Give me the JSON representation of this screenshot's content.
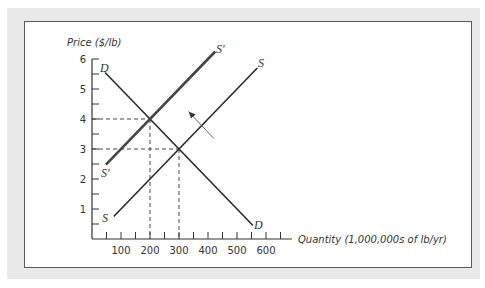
{
  "chart_data": {
    "type": "line",
    "title": "",
    "xlabel": "Quantity (1,000,000s of lb/yr)",
    "ylabel": "Price ($/lb)",
    "xlim": [
      0,
      690
    ],
    "ylim": [
      0,
      6
    ],
    "x_ticks": [
      100,
      200,
      300,
      400,
      500,
      600
    ],
    "x_minor_step": 50,
    "y_ticks": [
      1,
      2,
      3,
      4,
      5,
      6
    ],
    "y_minor_step": 0.5,
    "grid": false,
    "series": [
      {
        "name": "D",
        "label_start": "D",
        "label_end": "D",
        "points": [
          [
            45,
            5.55
          ],
          [
            555,
            0.45
          ]
        ],
        "color": "#2a2a2a",
        "width": 1.6
      },
      {
        "name": "S",
        "label_start": "S",
        "label_end": "S",
        "points": [
          [
            75,
            0.75
          ],
          [
            570,
            5.7
          ]
        ],
        "color": "#2a2a2a",
        "width": 1.6
      },
      {
        "name": "S'",
        "label_start": "S'",
        "label_end": "S'",
        "points": [
          [
            48,
            2.48
          ],
          [
            425,
            6.25
          ]
        ],
        "color": "#444444",
        "width": 2.6
      }
    ],
    "equilibria": [
      {
        "q": 200,
        "p": 4,
        "label": "new equilibrium"
      },
      {
        "q": 300,
        "p": 3,
        "label": "original equilibrium"
      }
    ],
    "annotations": [
      {
        "type": "arrow",
        "from": [
          420,
          3.35
        ],
        "to": [
          333,
          4.25
        ],
        "meaning": "supply shifts left from S to S'"
      }
    ]
  },
  "axis": {
    "ylabel": "Price ($/lb)",
    "xlabel": "Quantity (1,000,000s of lb/yr)",
    "y_tick_labels": [
      "1",
      "2",
      "3",
      "4",
      "5",
      "6"
    ],
    "x_tick_labels": [
      "100",
      "200",
      "300",
      "400",
      "500",
      "600"
    ]
  },
  "curve_labels": {
    "d_top": "D",
    "d_bottom": "D",
    "s_top": "S",
    "s_bottom": "S",
    "sprime_top": "S'",
    "sprime_bottom": "S'"
  }
}
